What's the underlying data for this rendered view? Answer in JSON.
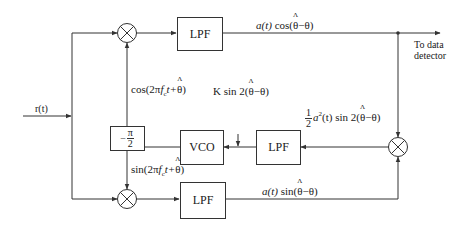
{
  "diagram": {
    "input": {
      "label": "r(t)"
    },
    "blocks": {
      "lpf_top": "LPF",
      "lpf_mid": "LPF",
      "lpf_bottom": "LPF",
      "vco": "VCO",
      "phase_shift": {
        "prefix": "−",
        "num": "π",
        "den": "2"
      }
    },
    "signals": {
      "top_output": {
        "pre": "a(t)",
        "func": "cos(",
        "hat": "θ",
        "post": "−θ)"
      },
      "cos_ref": {
        "pre": "cos(2π",
        "f": "f",
        "sub": "c",
        "t": "t+",
        "hat": "θ",
        "post": ")"
      },
      "sin_ref": {
        "pre": "sin(2π",
        "f": "f",
        "sub": "c",
        "t": "t+",
        "hat": "θ",
        "post": ")"
      },
      "error_mid": {
        "frac_num": "1",
        "frac_den": "2",
        "pre": "a",
        "sup": "2",
        "mid": "(t) sin 2(",
        "hat": "θ",
        "post": "−θ)"
      },
      "vco_control": {
        "pre": "K sin 2(",
        "hat": "θ",
        "post": "−θ)"
      },
      "bottom_output": {
        "pre": "a(t)",
        "func": "sin(",
        "hat": "θ",
        "post": "−θ)"
      }
    },
    "output": {
      "line1": "To data",
      "line2": "detector"
    },
    "colors": {
      "line": "#333333",
      "background": "#ffffff"
    }
  }
}
